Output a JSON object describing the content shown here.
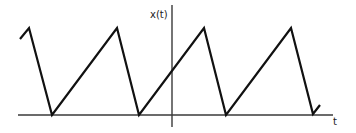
{
  "diagram": {
    "y_axis_label": "x(t)",
    "x_axis_label": "t",
    "colors": {
      "signal": "#111111",
      "axis": "#3a3a3a",
      "background": "#ffffff"
    },
    "axes": {
      "horizontal": {
        "x1": 18,
        "y1": 115,
        "x2": 333,
        "y2": 115
      },
      "vertical": {
        "x1": 172,
        "y1": 5,
        "x2": 172,
        "y2": 127
      }
    },
    "signal_points": [
      [
        20,
        39
      ],
      [
        29,
        28
      ],
      [
        52,
        115
      ],
      [
        117,
        28
      ],
      [
        139,
        115
      ],
      [
        204,
        28
      ],
      [
        226,
        115
      ],
      [
        291,
        28
      ],
      [
        313,
        114
      ],
      [
        320,
        105
      ]
    ],
    "label_positions": {
      "y_axis_label": {
        "x": 150,
        "y": 18
      },
      "x_axis_label": {
        "x": 333,
        "y": 125
      }
    }
  }
}
